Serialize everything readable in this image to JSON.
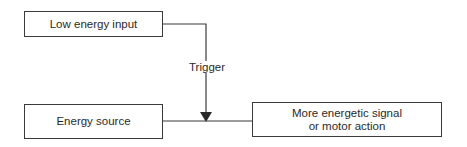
{
  "diagram": {
    "nodes": {
      "low_energy_input": {
        "label": "Low energy input"
      },
      "energy_source": {
        "label": "Energy source"
      },
      "output": {
        "line1": "More energetic signal",
        "line2": "or motor action"
      }
    },
    "edges": {
      "trigger": {
        "label": "Trigger",
        "from": "Low energy input",
        "to": "Energy source → More energetic signal or motor action junction"
      },
      "main_flow": {
        "from": "Energy source",
        "to": "More energetic signal or motor action"
      }
    },
    "colors": {
      "line": "#3a3a3a",
      "text": "#2a2a2a",
      "background": "#ffffff"
    }
  }
}
